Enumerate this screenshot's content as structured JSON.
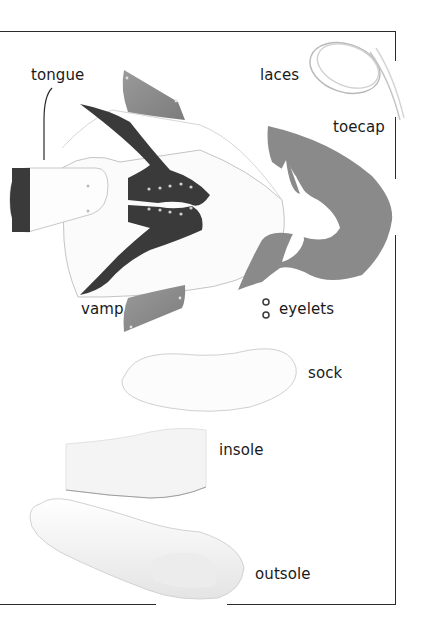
{
  "diagram": {
    "colors": {
      "dark_leather": "#3a3a3a",
      "grey_leather": "#8a8a8a",
      "white_leather": "#fbfbfb",
      "outline": "#bdbdbd",
      "text": "#1a1a1a",
      "frame": "#2b2b2b"
    },
    "labels": [
      {
        "id": "tongue",
        "text": "tongue"
      },
      {
        "id": "laces",
        "text": "laces"
      },
      {
        "id": "toecap",
        "text": "toecap"
      },
      {
        "id": "vamp",
        "text": "vamp"
      },
      {
        "id": "eyelets",
        "text": "eyelets"
      },
      {
        "id": "sock",
        "text": "sock"
      },
      {
        "id": "insole",
        "text": "insole"
      },
      {
        "id": "outsole",
        "text": "outsole"
      }
    ]
  }
}
